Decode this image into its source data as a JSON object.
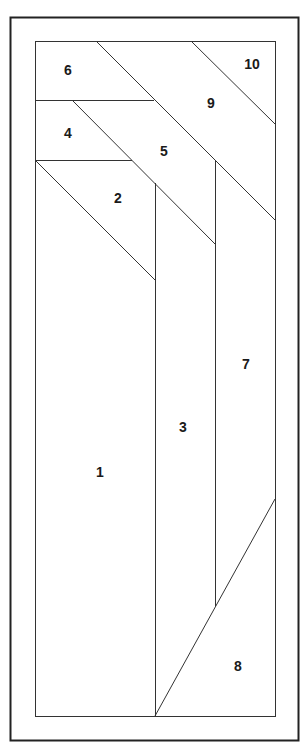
{
  "diagram": {
    "type": "foundation-piecing-pattern",
    "stroke_color": "#333333",
    "background": "#ffffff",
    "pieces": [
      {
        "id": "1",
        "label": "1",
        "x": 100,
        "y": 473
      },
      {
        "id": "2",
        "label": "2",
        "x": 118,
        "y": 199
      },
      {
        "id": "3",
        "label": "3",
        "x": 183,
        "y": 428
      },
      {
        "id": "4",
        "label": "4",
        "x": 68,
        "y": 134
      },
      {
        "id": "5",
        "label": "5",
        "x": 164,
        "y": 152
      },
      {
        "id": "6",
        "label": "6",
        "x": 68,
        "y": 71
      },
      {
        "id": "7",
        "label": "7",
        "x": 246,
        "y": 365
      },
      {
        "id": "8",
        "label": "8",
        "x": 238,
        "y": 667
      },
      {
        "id": "9",
        "label": "9",
        "x": 211,
        "y": 104
      },
      {
        "id": "10",
        "label": "10",
        "x": 252,
        "y": 65
      }
    ]
  }
}
